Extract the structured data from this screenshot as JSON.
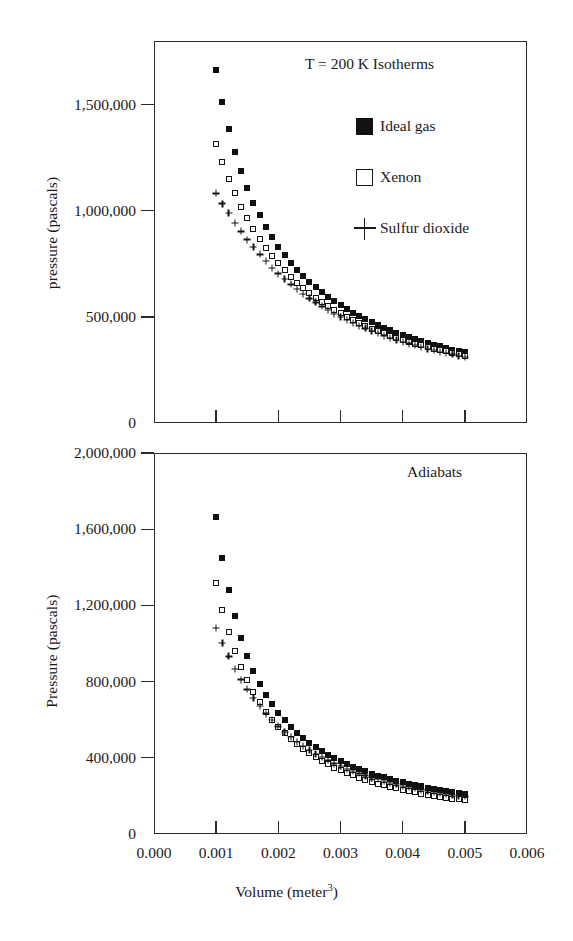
{
  "figure": {
    "width": 573,
    "height": 941,
    "background": "#ffffff",
    "ink_color": "#1a1a1a"
  },
  "x_axis": {
    "label_prefix": "Volume (meter",
    "label_superscript": "3",
    "label_suffix": ")",
    "label_full": "Volume (meter3)",
    "ticks": [
      "0.000",
      "0.001",
      "0.002",
      "0.003",
      "0.004",
      "0.005",
      "0.006"
    ],
    "tick_values": [
      0.0,
      0.001,
      0.002,
      0.003,
      0.004,
      0.005,
      0.006
    ],
    "min": 0.0,
    "max": 0.006
  },
  "top_panel": {
    "annotation": "T = 200 K Isotherms",
    "y_label": "pressure (pascals)",
    "y_ticks": [
      "0",
      "500,000",
      "1,000,000",
      "1,500,000"
    ],
    "y_tick_values": [
      0,
      500000,
      1000000,
      1500000
    ],
    "y_min": 0,
    "y_max": 1800000,
    "legend": [
      {
        "label": "Ideal gas",
        "marker": "filled-square"
      },
      {
        "label": "Xenon",
        "marker": "open-square"
      },
      {
        "label": "Sulfur dioxide",
        "marker": "plus"
      }
    ]
  },
  "bottom_panel": {
    "annotation": "Adiabats",
    "y_label": "Pressure (pascals)",
    "y_ticks": [
      "0",
      "400,000",
      "800,000",
      "1,200,000",
      "1,600,000",
      "2,000,000"
    ],
    "y_tick_values": [
      0,
      400000,
      800000,
      1200000,
      1600000,
      2000000
    ],
    "y_min": 0,
    "y_max": 2000000
  },
  "chart_data": [
    {
      "type": "scatter",
      "title": "T = 200 K Isotherms",
      "xlabel": "Volume (meter^3)",
      "ylabel": "pressure (pascals)",
      "xlim": [
        0.0,
        0.006
      ],
      "ylim": [
        0,
        1800000
      ],
      "xticks": [
        0.0,
        0.001,
        0.002,
        0.003,
        0.004,
        0.005,
        0.006
      ],
      "yticks": [
        0,
        500000,
        1000000,
        1500000
      ],
      "grid": false,
      "legend_position": "upper-right-inside",
      "x": [
        0.001,
        0.0011,
        0.0012,
        0.0013,
        0.0014,
        0.0015,
        0.0016,
        0.0017,
        0.0018,
        0.0019,
        0.002,
        0.0021,
        0.0022,
        0.0023,
        0.0024,
        0.0025,
        0.0026,
        0.0027,
        0.0028,
        0.0029,
        0.003,
        0.0031,
        0.0032,
        0.0033,
        0.0034,
        0.0035,
        0.0036,
        0.0037,
        0.0038,
        0.0039,
        0.004,
        0.0041,
        0.0042,
        0.0043,
        0.0044,
        0.0045,
        0.0046,
        0.0047,
        0.0048,
        0.0049,
        0.005
      ],
      "series": [
        {
          "name": "Ideal gas",
          "marker": "filled-square",
          "values": [
            1662000,
            1511000,
            1385000,
            1278000,
            1187000,
            1108000,
            1039000,
            978000,
            924000,
            875000,
            831000,
            792000,
            756000,
            723000,
            693000,
            665000,
            639000,
            616000,
            594000,
            573000,
            554000,
            536000,
            519000,
            504000,
            489000,
            475000,
            462000,
            449000,
            437000,
            426000,
            416000,
            405000,
            396000,
            387000,
            378000,
            369000,
            361000,
            354000,
            346000,
            339000,
            333000
          ]
        },
        {
          "name": "Xenon",
          "marker": "open-square",
          "values": [
            1315000,
            1230000,
            1152000,
            1082000,
            1020000,
            964000,
            913000,
            867000,
            825000,
            787000,
            752000,
            720000,
            690000,
            662000,
            637000,
            613000,
            591000,
            570000,
            551000,
            533000,
            516000,
            500000,
            485000,
            471000,
            458000,
            445000,
            434000,
            422000,
            412000,
            402000,
            392000,
            383000,
            374000,
            366000,
            358000,
            351000,
            343000,
            337000,
            330000,
            324000,
            318000
          ]
        },
        {
          "name": "Sulfur dioxide",
          "marker": "plus",
          "values": [
            1082000,
            1034000,
            988000,
            944000,
            903000,
            864000,
            828000,
            794000,
            762000,
            732000,
            704000,
            678000,
            653000,
            630000,
            608000,
            587000,
            568000,
            549000,
            532000,
            515000,
            500000,
            485000,
            471000,
            458000,
            446000,
            434000,
            423000,
            412000,
            402000,
            392000,
            383000,
            374000,
            366000,
            358000,
            350000,
            343000,
            336000,
            329000,
            323000,
            317000,
            311000
          ]
        }
      ]
    },
    {
      "type": "scatter",
      "title": "Adiabats",
      "xlabel": "Volume (meter^3)",
      "ylabel": "Pressure (pascals)",
      "xlim": [
        0.0,
        0.006
      ],
      "ylim": [
        0,
        2000000
      ],
      "xticks": [
        0.0,
        0.001,
        0.002,
        0.003,
        0.004,
        0.005,
        0.006
      ],
      "yticks": [
        0,
        400000,
        800000,
        1200000,
        1600000,
        2000000
      ],
      "grid": false,
      "legend_position": "none",
      "x": [
        0.001,
        0.0011,
        0.0012,
        0.0013,
        0.0014,
        0.0015,
        0.0016,
        0.0017,
        0.0018,
        0.0019,
        0.002,
        0.0021,
        0.0022,
        0.0023,
        0.0024,
        0.0025,
        0.0026,
        0.0027,
        0.0028,
        0.0029,
        0.003,
        0.0031,
        0.0032,
        0.0033,
        0.0034,
        0.0035,
        0.0036,
        0.0037,
        0.0038,
        0.0039,
        0.004,
        0.0041,
        0.0042,
        0.0043,
        0.0044,
        0.0045,
        0.0046,
        0.0047,
        0.0048,
        0.0049,
        0.005
      ],
      "series": [
        {
          "name": "Ideal gas",
          "marker": "filled-square",
          "values": [
            1662000,
            1448000,
            1279000,
            1142000,
            1030000,
            936000,
            857000,
            790000,
            732000,
            681000,
            637000,
            598000,
            563000,
            532000,
            504000,
            479000,
            456000,
            435000,
            416000,
            398000,
            382000,
            367000,
            353000,
            340000,
            329000,
            317000,
            307000,
            297000,
            288000,
            280000,
            272000,
            264000,
            257000,
            250000,
            244000,
            238000,
            232000,
            227000,
            222000,
            217000,
            212000
          ]
        },
        {
          "name": "Xenon",
          "marker": "open-square",
          "values": [
            1315000,
            1175000,
            1060000,
            962000,
            879000,
            807000,
            745000,
            691000,
            643000,
            601000,
            563000,
            529000,
            499000,
            471000,
            446000,
            423000,
            402000,
            383000,
            366000,
            349000,
            334000,
            320000,
            308000,
            296000,
            285000,
            274000,
            265000,
            256000,
            247000,
            239000,
            232000,
            225000,
            218000,
            212000,
            206000,
            201000,
            196000,
            191000,
            186000,
            182000,
            178000
          ]
        },
        {
          "name": "Sulfur dioxide",
          "marker": "plus",
          "values": [
            1082000,
            1003000,
            932000,
            868000,
            811000,
            759000,
            713000,
            671000,
            632000,
            597000,
            565000,
            536000,
            509000,
            484000,
            461000,
            440000,
            421000,
            403000,
            386000,
            370000,
            356000,
            342000,
            330000,
            318000,
            307000,
            296000,
            287000,
            277000,
            269000,
            261000,
            253000,
            246000,
            239000,
            233000,
            227000,
            221000,
            216000,
            211000,
            206000,
            201000,
            197000
          ]
        }
      ]
    }
  ]
}
